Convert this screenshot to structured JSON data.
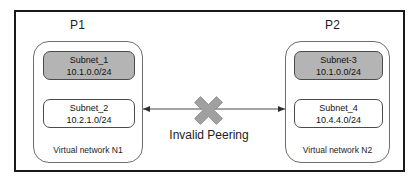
{
  "diagram": {
    "title_left": "P1",
    "title_right": "P2",
    "connection": {
      "label": "Invalid Peering",
      "status_icon": "x-cross-icon",
      "status_color": "#a0a0a0",
      "line_color": "#4a4a4a",
      "arrow_direction": "bidirectional"
    },
    "networks": [
      {
        "id": "n1",
        "label": "Virtual network N1",
        "subnets": [
          {
            "name": "Subnet_1",
            "cidr": "10.1.0.0/24",
            "shaded": true,
            "fill": "#b4b4b4"
          },
          {
            "name": "Subnet_2",
            "cidr": "10.2.1.0/24",
            "shaded": false,
            "fill": "#ffffff"
          }
        ]
      },
      {
        "id": "n2",
        "label": "Virtual network N2",
        "subnets": [
          {
            "name": "Subnet-3",
            "cidr": "10.1.0.0/24",
            "shaded": true,
            "fill": "#b4b4b4"
          },
          {
            "name": "Subnet_4",
            "cidr": "10.4.4.0/24",
            "shaded": false,
            "fill": "#ffffff"
          }
        ]
      }
    ]
  }
}
